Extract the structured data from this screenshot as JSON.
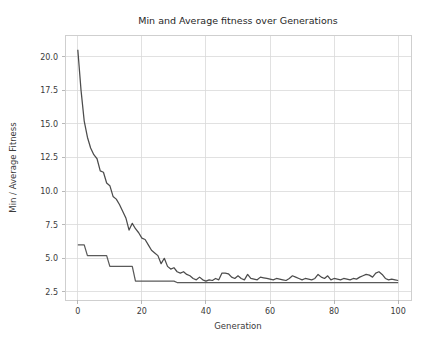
{
  "chart_data": {
    "type": "line",
    "title": "Min and Average fitness over Generations",
    "xlabel": "Generation",
    "ylabel": "Min / Average Fitness",
    "xlim": [
      -4,
      104
    ],
    "ylim": [
      1.9,
      21.6
    ],
    "xticks": [
      0,
      20,
      40,
      60,
      80,
      100
    ],
    "yticks": [
      2.5,
      5.0,
      7.5,
      10.0,
      12.5,
      15.0,
      17.5,
      20.0
    ],
    "xtick_labels": [
      "0",
      "20",
      "40",
      "60",
      "80",
      "100"
    ],
    "ytick_labels": [
      "2.5",
      "5.0",
      "7.5",
      "10.0",
      "12.5",
      "15.0",
      "17.5",
      "20.0"
    ],
    "grid": true,
    "legend": null,
    "background_color": "#ffffff",
    "grid_color": "#d9d9d9",
    "x": [
      0,
      1,
      2,
      3,
      4,
      5,
      6,
      7,
      8,
      9,
      10,
      11,
      12,
      13,
      14,
      15,
      16,
      17,
      18,
      19,
      20,
      21,
      22,
      23,
      24,
      25,
      26,
      27,
      28,
      29,
      30,
      31,
      32,
      33,
      34,
      35,
      36,
      37,
      38,
      39,
      40,
      41,
      42,
      43,
      44,
      45,
      46,
      47,
      48,
      49,
      50,
      51,
      52,
      53,
      54,
      55,
      56,
      57,
      58,
      59,
      60,
      61,
      62,
      63,
      64,
      65,
      66,
      67,
      68,
      69,
      70,
      71,
      72,
      73,
      74,
      75,
      76,
      77,
      78,
      79,
      80,
      81,
      82,
      83,
      84,
      85,
      86,
      87,
      88,
      89,
      90,
      91,
      92,
      93,
      94,
      95,
      96,
      97,
      98,
      99,
      100
    ],
    "series": [
      {
        "name": "Average Fitness",
        "color": "#4c4c4c",
        "values": [
          20.5,
          17.5,
          15.2,
          14.0,
          13.2,
          12.7,
          12.4,
          11.5,
          11.4,
          10.6,
          10.4,
          9.6,
          9.4,
          9.0,
          8.5,
          8.0,
          7.1,
          7.6,
          7.2,
          6.9,
          6.5,
          6.4,
          6.0,
          5.6,
          5.4,
          5.2,
          4.6,
          5.0,
          4.4,
          4.2,
          4.3,
          4.0,
          3.9,
          4.0,
          3.8,
          3.7,
          3.5,
          3.4,
          3.6,
          3.4,
          3.3,
          3.4,
          3.35,
          3.5,
          3.4,
          3.9,
          3.9,
          3.85,
          3.6,
          3.5,
          3.7,
          3.5,
          3.4,
          3.8,
          3.5,
          3.45,
          3.4,
          3.6,
          3.55,
          3.5,
          3.45,
          3.4,
          3.5,
          3.45,
          3.4,
          3.35,
          3.5,
          3.7,
          3.6,
          3.5,
          3.4,
          3.5,
          3.45,
          3.4,
          3.5,
          3.8,
          3.6,
          3.5,
          3.7,
          3.4,
          3.5,
          3.45,
          3.4,
          3.5,
          3.45,
          3.4,
          3.5,
          3.45,
          3.6,
          3.7,
          3.8,
          3.75,
          3.6,
          3.9,
          4.0,
          3.8,
          3.5,
          3.4,
          3.45,
          3.4,
          3.35
        ]
      },
      {
        "name": "Min Fitness",
        "color": "#5a5a5a",
        "values": [
          6.0,
          6.0,
          6.0,
          5.2,
          5.2,
          5.2,
          5.2,
          5.2,
          5.2,
          5.2,
          4.4,
          4.4,
          4.4,
          4.4,
          4.4,
          4.4,
          4.4,
          4.4,
          3.3,
          3.3,
          3.3,
          3.3,
          3.3,
          3.3,
          3.3,
          3.3,
          3.3,
          3.3,
          3.3,
          3.3,
          3.3,
          3.2,
          3.2,
          3.2,
          3.2,
          3.2,
          3.2,
          3.2,
          3.2,
          3.2,
          3.2,
          3.2,
          3.2,
          3.2,
          3.2,
          3.2,
          3.2,
          3.2,
          3.2,
          3.2,
          3.2,
          3.2,
          3.2,
          3.2,
          3.2,
          3.2,
          3.2,
          3.2,
          3.2,
          3.2,
          3.2,
          3.2,
          3.2,
          3.2,
          3.2,
          3.2,
          3.2,
          3.2,
          3.2,
          3.2,
          3.2,
          3.2,
          3.2,
          3.2,
          3.2,
          3.2,
          3.2,
          3.2,
          3.2,
          3.2,
          3.2,
          3.2,
          3.2,
          3.2,
          3.2,
          3.2,
          3.2,
          3.2,
          3.2,
          3.2,
          3.2,
          3.2,
          3.2,
          3.2,
          3.2,
          3.2,
          3.2,
          3.2,
          3.2,
          3.2,
          3.2
        ]
      }
    ]
  }
}
